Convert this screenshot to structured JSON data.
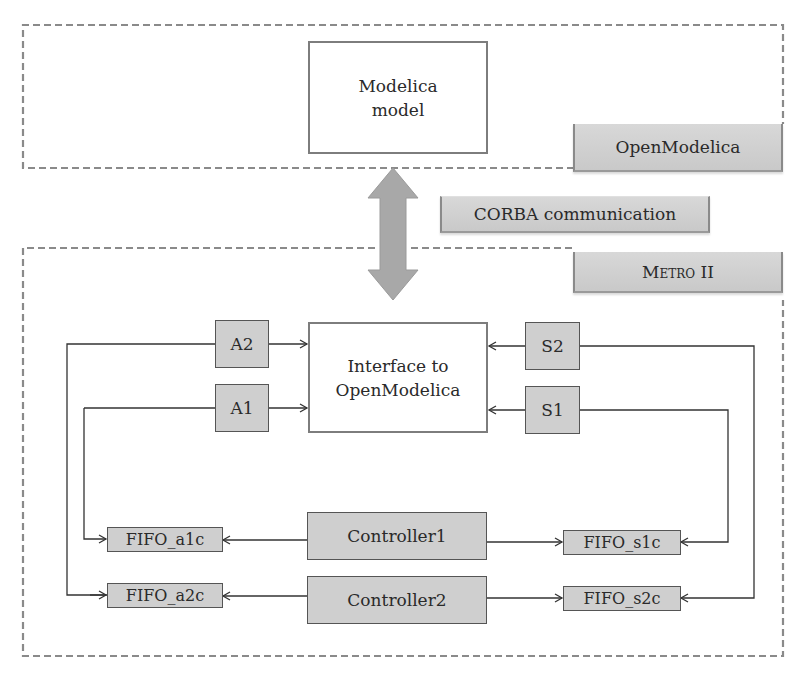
{
  "top_region": {
    "model_box": {
      "line1": "Modelica",
      "line2": "model"
    },
    "label": "OpenModelica"
  },
  "link": {
    "label": "CORBA communication",
    "arrow": "double-vertical-arrow"
  },
  "bottom_region": {
    "label": "Metro II",
    "interface_box": {
      "line1": "Interface to",
      "line2": "OpenModelica"
    },
    "actuators": [
      "A2",
      "A1"
    ],
    "sensors": [
      "S2",
      "S1"
    ],
    "controllers": [
      "Controller1",
      "Controller2"
    ],
    "fifos_actuator": [
      "FIFO_a1c",
      "FIFO_a2c"
    ],
    "fifos_sensor": [
      "FIFO_s1c",
      "FIFO_s2c"
    ]
  },
  "colors": {
    "dashed_border": "#8a8a8a",
    "block_fill": "#cfcfcf",
    "label_fill": "#d2d2d2",
    "arrow_fill": "#a8a8a8",
    "line": "#333333"
  }
}
